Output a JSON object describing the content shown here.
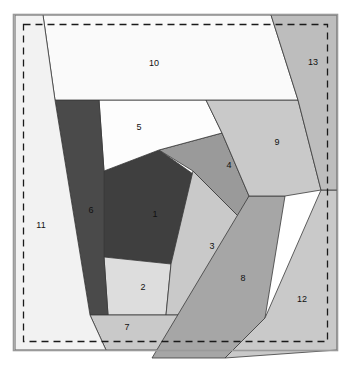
{
  "figure": {
    "title": "",
    "width": 353,
    "height": 366,
    "background_color": "#ffffff"
  },
  "frame": {
    "name": "outer-frame",
    "x": 13.5,
    "y": 14.5,
    "width": 324,
    "height": 336,
    "stroke_color": "#9a9a9a",
    "fill_color": "#ffffff"
  },
  "dashed_boundary": {
    "name": "dashed-bounding-box",
    "x": 23.5,
    "y": 24.5,
    "width": 304,
    "height": 317,
    "stroke_color": "#1a1a1a",
    "dash": "7 5"
  },
  "palette": {
    "very_dark": "#3f3f3f",
    "dark": "#4a4a4a",
    "medium": "#9a9a9a",
    "medium_light": "#a6a6a6",
    "light": "#c9c9c9",
    "lighter": "#d8d8d8",
    "near_white": "#efefef",
    "white": "#fdfdfd",
    "outline": "#3a3a3a"
  },
  "chart_data": {
    "type": "diagram",
    "subtype": "planar-polygon-partition",
    "region_count": 13,
    "labels": [
      "1",
      "2",
      "3",
      "4",
      "5",
      "6",
      "7",
      "8",
      "9",
      "10",
      "11",
      "12",
      "13"
    ],
    "xlim": [
      0,
      353
    ],
    "ylim": [
      0,
      366
    ],
    "grid": false,
    "legend": "none",
    "regions": [
      {
        "id": "1",
        "label": "1",
        "color": "#3f3f3f",
        "label_x": 155,
        "label_y": 215,
        "points": "104,171 159,150 220,193 171,264 104,257"
      },
      {
        "id": "2",
        "label": "2",
        "color": "#dddddd",
        "label_x": 143,
        "label_y": 288,
        "points": "104,257 171,264 166,315 108,315"
      },
      {
        "id": "3",
        "label": "3",
        "color": "#c9c9c9",
        "label_x": 212,
        "label_y": 247,
        "points": "193,171 240,218 196,315 166,315 171,264"
      },
      {
        "id": "4",
        "label": "4",
        "color": "#9a9a9a",
        "label_x": 229,
        "label_y": 166,
        "points": "159,150 222,133 249,196 240,218 193,171"
      },
      {
        "id": "5",
        "label": "5",
        "color": "#fdfdfd",
        "label_x": 139,
        "label_y": 128,
        "points": "99,100 206,100 222,133 159,150 104,171"
      },
      {
        "id": "6",
        "label": "6",
        "color": "#4a4a4a",
        "label_x": 91,
        "label_y": 211,
        "points": "55,100 99,100 104,171 104,257 108,315 90,315"
      },
      {
        "id": "7",
        "label": "7",
        "color": "#c9c9c9",
        "label_x": 127,
        "label_y": 328,
        "points": "90,315 108,315 166,315 196,315 177,350 106,350"
      },
      {
        "id": "8",
        "label": "8",
        "color": "#a6a6a6",
        "label_x": 243,
        "label_y": 279,
        "points": "249,196 285,196 265,318 225,358 152,358"
      },
      {
        "id": "9",
        "label": "9",
        "color": "#c9c9c9",
        "label_x": 277,
        "label_y": 143,
        "points": "206,100 298,100 321,190 285,196 249,196 222,133"
      },
      {
        "id": "10",
        "label": "10",
        "color": "#fafafa",
        "label_x": 154,
        "label_y": 64,
        "points": "43,15 271,15 298,100 206,100 99,100 55,100"
      },
      {
        "id": "11",
        "label": "11",
        "color": "#f2f2f2",
        "label_x": 41,
        "label_y": 226,
        "points": "43,15 55,100 90,315 106,350 15,350 15,15"
      },
      {
        "id": "12",
        "label": "12",
        "color": "#c9c9c9",
        "label_x": 302,
        "label_y": 300,
        "points": "321,190 337,190 337,350 225,358 265,318"
      },
      {
        "id": "13",
        "label": "13",
        "color": "#bdbdbd",
        "label_x": 313,
        "label_y": 63,
        "points": "271,15 337,15 337,190 321,190 298,100"
      }
    ]
  }
}
